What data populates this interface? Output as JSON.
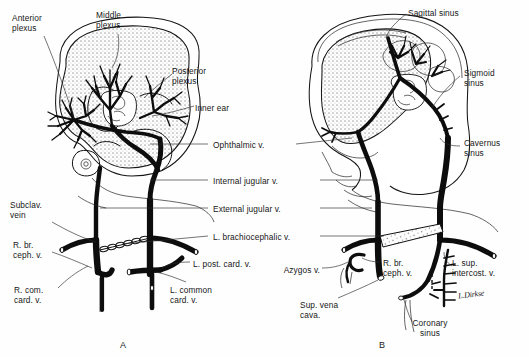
{
  "plate": {
    "title": "Development of the cranial and thoracic venous system",
    "background": "#fefefe",
    "ink_color": "#111111",
    "width": 529,
    "height": 357
  },
  "panels": [
    {
      "id": "A",
      "letter": "A",
      "x": 120,
      "y": 340
    },
    {
      "id": "B",
      "letter": "B",
      "x": 379,
      "y": 340
    }
  ],
  "labels_left": [
    {
      "name": "anterior-plexus",
      "text": "Anterior\nplexus",
      "x": 12,
      "y": 13
    },
    {
      "name": "middle-plexus",
      "text": "Middle\nplexus",
      "x": 96,
      "y": 10
    },
    {
      "name": "subclavian-vein",
      "text": "Subclav.\nvein",
      "x": 10,
      "y": 200
    },
    {
      "name": "r-br-ceph-v",
      "text": "R. br.\nceph. v.",
      "x": 13,
      "y": 240
    },
    {
      "name": "r-com-card-v",
      "text": "R. com.\ncard. v.",
      "x": 14,
      "y": 285
    }
  ],
  "labels_left_inner": [
    {
      "name": "posterior-plexus",
      "text": "Posterior\nplexus",
      "x": 172,
      "y": 66
    },
    {
      "name": "inner-ear",
      "text": "Inner ear",
      "x": 195,
      "y": 103
    },
    {
      "name": "l-post-card-v",
      "text": "L. post. card. v.",
      "x": 193,
      "y": 259
    },
    {
      "name": "l-common-card-v",
      "text": "L. common\ncard. v.",
      "x": 170,
      "y": 285
    }
  ],
  "labels_center": [
    {
      "name": "ophthalmic-v",
      "text": "Ophthalmic v.",
      "x": 213,
      "y": 140,
      "leader_left": true,
      "leader_right": true
    },
    {
      "name": "internal-jugular-v",
      "text": "Internal jugular v.",
      "x": 213,
      "y": 176,
      "leader_left": true,
      "leader_right": true
    },
    {
      "name": "external-jugular-v",
      "text": "External jugular v.",
      "x": 213,
      "y": 204,
      "leader_left": true,
      "leader_right": true
    },
    {
      "name": "l-brachiocephalic-v",
      "text": "L. brachiocephalic v.",
      "x": 213,
      "y": 232,
      "leader_left": true,
      "leader_right": true
    }
  ],
  "labels_right": [
    {
      "name": "sagittal-sinus",
      "text": "Sagittal sinus",
      "x": 408,
      "y": 8
    },
    {
      "name": "sigmoid-sinus",
      "text": "Sigmoid\nsinus",
      "x": 464,
      "y": 68
    },
    {
      "name": "cavernus-sinus",
      "text": "Cavernus\nsinus",
      "x": 464,
      "y": 138
    },
    {
      "name": "l-sup-intercost-v",
      "text": "L. sup.\nintercost. v.",
      "x": 452,
      "y": 258
    }
  ],
  "labels_right_inner": [
    {
      "name": "azygos-v",
      "text": "Azygos v.",
      "x": 287,
      "y": 265
    },
    {
      "name": "r-br-ceph-v-b",
      "text": "R. br.\nceph. v.",
      "x": 383,
      "y": 258
    },
    {
      "name": "sup-vena-cava",
      "text": "Sup. vena\ncava.",
      "x": 300,
      "y": 300
    },
    {
      "name": "coronary-sinus",
      "text": "Coronary\nsinus",
      "x": 412,
      "y": 318
    }
  ],
  "signature": {
    "name": "artist-signature",
    "text": "L.Dirkse",
    "x": 458,
    "y": 290
  }
}
